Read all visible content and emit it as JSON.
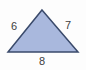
{
  "figure": {
    "type": "triangle",
    "shape_name": "triangle-shape",
    "fill_color": "#a9b8dd",
    "stroke_color": "#3a4a6b",
    "stroke_width": 1.5,
    "background_color": "#fdfdfd",
    "label_color": "#3d3d3d",
    "vertices": {
      "apex": [
        42,
        10
      ],
      "bottom_left": [
        8,
        52
      ],
      "bottom_right": [
        78,
        52
      ]
    },
    "labels": {
      "left_side": "6",
      "right_side": "7",
      "bottom_side": "8"
    }
  }
}
